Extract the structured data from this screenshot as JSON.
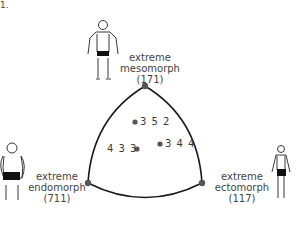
{
  "fragment": "1.",
  "diagram": {
    "type": "somatochart",
    "vertices": [
      {
        "id": "mesomorph",
        "line1": "extreme",
        "line2": "mesomorph",
        "code": "(171)"
      },
      {
        "id": "endomorph",
        "line1": "extreme",
        "line2": "endomorph",
        "code": "(711)"
      },
      {
        "id": "ectomorph",
        "line1": "extreme",
        "line2": "ectomorph",
        "code": "(117)"
      }
    ],
    "points": [
      {
        "label": "3 5 2"
      },
      {
        "label": "3 4 4"
      },
      {
        "label": "4 3 3"
      }
    ],
    "colors": {
      "outline": "#1a1a1a",
      "dot": "#555555",
      "text": "#444444"
    }
  }
}
